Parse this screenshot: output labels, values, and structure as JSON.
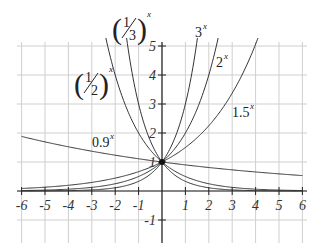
{
  "chart_data": {
    "type": "line",
    "title": "",
    "xlabel": "",
    "ylabel": "",
    "xlim": [
      -6,
      6
    ],
    "ylim": [
      -1,
      5
    ],
    "grid": true,
    "legend": "inline labels",
    "x_ticks": [
      "-6",
      "-5",
      "-4",
      "-3",
      "-2",
      "-1",
      "1",
      "2",
      "3",
      "4",
      "5",
      "6"
    ],
    "y_ticks": [
      "5",
      "4",
      "3",
      "2",
      "1",
      "-1"
    ],
    "series": [
      {
        "name": "3^x",
        "base": 3,
        "values_at_x": {
          "-2": 0.111,
          "-1": 0.333,
          "0": 1,
          "1": 3,
          "1.5": 5.196
        }
      },
      {
        "name": "2^x",
        "base": 2,
        "values_at_x": {
          "-2": 0.25,
          "-1": 0.5,
          "0": 1,
          "1": 2,
          "2": 4
        }
      },
      {
        "name": "1.5^x",
        "base": 1.5,
        "values_at_x": {
          "-2": 0.444,
          "-1": 0.667,
          "0": 1,
          "1": 1.5,
          "2": 2.25,
          "3": 3.375,
          "4": 5.063
        }
      },
      {
        "name": "0.9^x",
        "base": 0.9,
        "values_at_x": {
          "-6": 1.882,
          "-3": 1.372,
          "0": 1,
          "3": 0.729,
          "6": 0.531
        }
      },
      {
        "name": "(1/2)^x",
        "base": 0.5,
        "values_at_x": {
          "-2": 4,
          "-1": 2,
          "0": 1,
          "1": 0.5,
          "2": 0.25
        }
      },
      {
        "name": "(1/3)^x",
        "base": 0.3333,
        "values_at_x": {
          "-1.5": 5.196,
          "-1": 3,
          "0": 1,
          "1": 0.333,
          "2": 0.111
        }
      }
    ],
    "annotations": [
      {
        "text": "(1/3)^x",
        "numerator": "1",
        "denominator": "3",
        "sup": "x"
      },
      {
        "text": "(1/2)^x",
        "numerator": "1",
        "denominator": "2",
        "sup": "x"
      },
      {
        "text": "3^x",
        "base": "3",
        "sup": "x"
      },
      {
        "text": "2^x",
        "base": "2",
        "sup": "x"
      },
      {
        "text": "1.5^x",
        "base": "1.5",
        "sup": "x"
      },
      {
        "text": "0.9^x",
        "base": "0.9",
        "sup": "x"
      }
    ],
    "common_point": {
      "x": 0,
      "y": 1
    }
  },
  "style": {
    "grid_color": "#cfcfcf",
    "axis_color": "#222222",
    "curve_color": "#333333"
  }
}
